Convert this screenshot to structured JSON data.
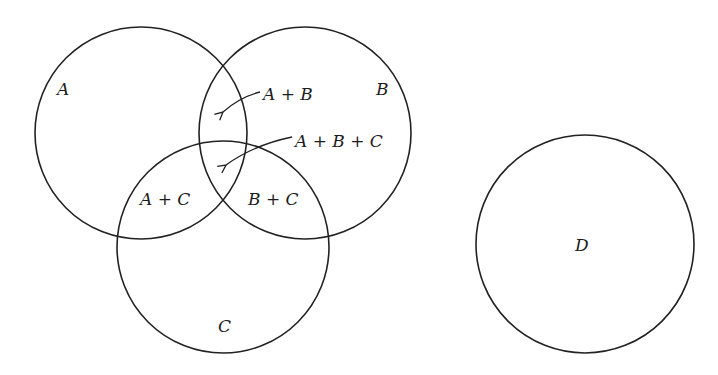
{
  "diagram": {
    "type": "venn",
    "circles": [
      {
        "id": "A",
        "cx": 141,
        "cy": 133,
        "r": 106
      },
      {
        "id": "B",
        "cx": 305,
        "cy": 133,
        "r": 106
      },
      {
        "id": "C",
        "cx": 223,
        "cy": 247,
        "r": 106
      },
      {
        "id": "D",
        "cx": 585,
        "cy": 244,
        "r": 109
      }
    ],
    "labels": {
      "a": "A",
      "b": "B",
      "c": "C",
      "d": "D",
      "a_plus_b": "A + B",
      "a_plus_b_plus_c": "A + B + C",
      "a_plus_c": "A + C",
      "b_plus_c": "B + C"
    },
    "stroke_color": "#222222",
    "background": "#ffffff"
  }
}
